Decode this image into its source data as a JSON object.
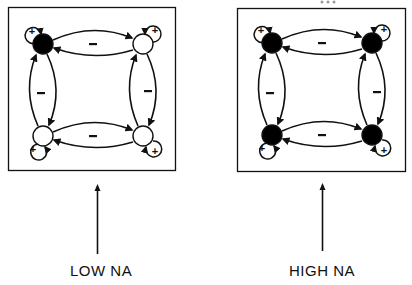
{
  "figure": {
    "panels": [
      {
        "id": "low-na",
        "label": "LOW NA",
        "nodes": [
          {
            "position": "top-left",
            "state": "filled"
          },
          {
            "position": "top-right",
            "state": "open"
          },
          {
            "position": "bottom-left",
            "state": "open"
          },
          {
            "position": "bottom-right",
            "state": "open"
          }
        ],
        "self_loop_sign": "+",
        "edge_sign": "-"
      },
      {
        "id": "high-na",
        "label": "HIGH NA",
        "nodes": [
          {
            "position": "top-left",
            "state": "filled"
          },
          {
            "position": "top-right",
            "state": "filled"
          },
          {
            "position": "bottom-left",
            "state": "filled"
          },
          {
            "position": "bottom-right",
            "state": "filled"
          }
        ],
        "self_loop_sign": "+",
        "edge_sign": "-"
      }
    ],
    "signs": {
      "plus": "+",
      "minus": "-"
    },
    "colors": {
      "ink": "#111111",
      "filled_node": "#000000",
      "open_node": "#ffffff",
      "background": "#ffffff"
    }
  }
}
